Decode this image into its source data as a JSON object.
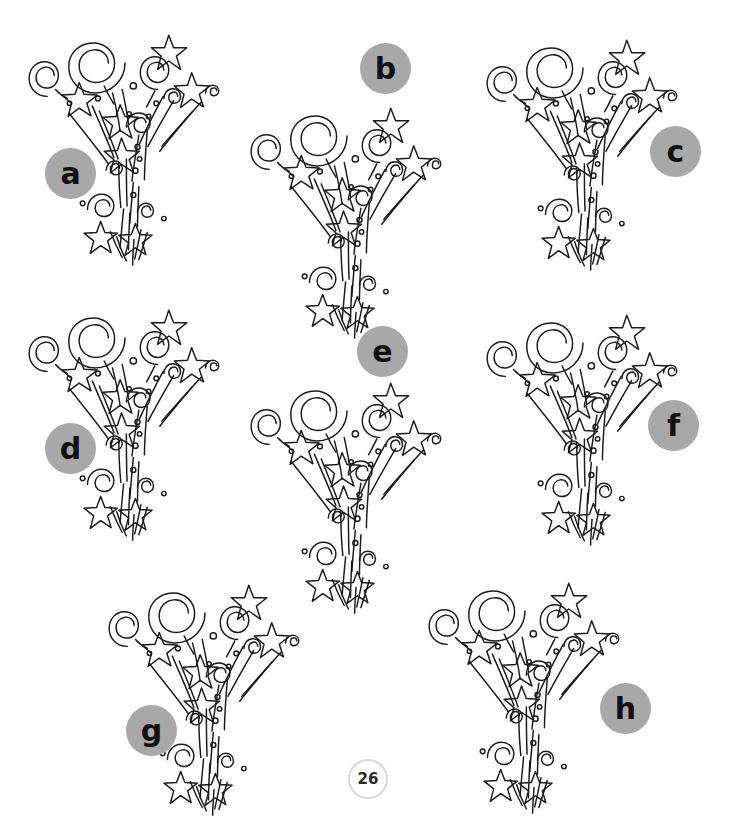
{
  "page": {
    "width": 729,
    "height": 830,
    "background_color": "#ffffff",
    "ink_color": "#1a1a1a",
    "label_circle_color": "#a8a8a8",
    "label_text_color": "#111111",
    "page_number": "26",
    "page_number_border_color": "#d8d8d8"
  },
  "top_cut_text": {
    "fragment_left": "",
    "fragment_right": ""
  },
  "items": [
    {
      "id": "a",
      "label": "a",
      "fw_x": 10,
      "fw_y": 20,
      "label_x": 45,
      "label_y": 148
    },
    {
      "id": "b",
      "label": "b",
      "fw_x": 232,
      "fw_y": 93,
      "label_x": 360,
      "label_y": 43
    },
    {
      "id": "c",
      "label": "c",
      "fw_x": 468,
      "fw_y": 25,
      "label_x": 650,
      "label_y": 126
    },
    {
      "id": "d",
      "label": "d",
      "fw_x": 10,
      "fw_y": 295,
      "label_x": 45,
      "label_y": 423
    },
    {
      "id": "e",
      "label": "e",
      "fw_x": 232,
      "fw_y": 368,
      "label_x": 357,
      "label_y": 326
    },
    {
      "id": "f",
      "label": "f",
      "fw_x": 468,
      "fw_y": 300,
      "label_x": 648,
      "label_y": 400
    },
    {
      "id": "g",
      "label": "g",
      "fw_x": 90,
      "fw_y": 570,
      "label_x": 126,
      "label_y": 705
    },
    {
      "id": "h",
      "label": "h",
      "fw_x": 410,
      "fw_y": 568,
      "label_x": 600,
      "label_y": 683
    }
  ]
}
